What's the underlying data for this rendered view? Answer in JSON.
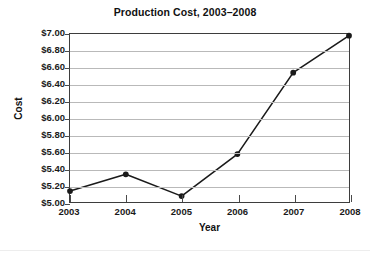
{
  "chart_data": {
    "type": "line",
    "title": "Production Cost, 2003–2008",
    "xlabel": "Year",
    "ylabel": "Cost",
    "categories": [
      "2003",
      "2004",
      "2005",
      "2006",
      "2007",
      "2008"
    ],
    "x": [
      2003,
      2004,
      2005,
      2006,
      2007,
      2008
    ],
    "values": [
      5.13,
      5.33,
      5.07,
      5.57,
      6.54,
      6.98
    ],
    "series": [
      {
        "name": "Production Cost",
        "values": [
          5.13,
          5.33,
          5.07,
          5.57,
          6.54,
          6.98
        ]
      }
    ],
    "ytick_labels": [
      "$7.00",
      "$6.80",
      "$6.60",
      "$6.40",
      "$6.20",
      "$6.00",
      "$5.80",
      "$5.60",
      "$5.40",
      "$5.20",
      "$5.00"
    ],
    "ytick_values": [
      7.0,
      6.8,
      6.6,
      6.4,
      6.2,
      6.0,
      5.8,
      5.6,
      5.4,
      5.2,
      5.0
    ],
    "xtick_labels": [
      "2003",
      "2004",
      "2005",
      "2006",
      "2007",
      "2008"
    ],
    "ylim": [
      5.0,
      7.0
    ],
    "xlim": [
      2003,
      2008
    ],
    "grid": true,
    "grid_axis": "y",
    "legend": false,
    "marker": "circle",
    "line_color": "#1a1a1a",
    "marker_color": "#1a1a1a",
    "grid_color": "#b9b9b9",
    "axis_color": "#3d3d3d",
    "background_color": "#ffffff"
  }
}
